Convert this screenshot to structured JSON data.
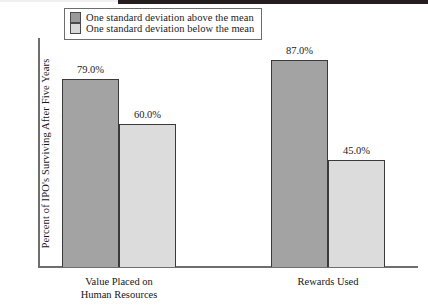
{
  "chart_data": {
    "type": "bar",
    "title": "",
    "xlabel": "",
    "ylabel": "Percent of IPO's Surviving After Five Years",
    "ylim": [
      0,
      96
    ],
    "grid": false,
    "legend_position": "top-center",
    "categories": [
      "Value Placed on\nHuman Resources",
      "Rewards Used"
    ],
    "series": [
      {
        "name": "One standard deviation above the mean",
        "color": "#a3a3a3",
        "values": [
          79.0,
          60.0
        ]
      },
      {
        "name": "One standard deviation below the mean",
        "color": "#dcdcdc",
        "values": [
          87.0,
          45.0
        ]
      }
    ],
    "data_labels": [
      "79.0%",
      "60.0%",
      "87.0%",
      "45.0%"
    ]
  },
  "legend": {
    "items": [
      {
        "label": "One standard deviation above the mean",
        "swatch": "above"
      },
      {
        "label": "One standard deviation below the mean",
        "swatch": "below"
      }
    ]
  },
  "axis": {
    "y_title": "Percent of IPO's Surviving After Five Years"
  },
  "categories": [
    {
      "line1": "Value Placed on",
      "line2": "Human Resources"
    },
    {
      "line1": "Rewards Used",
      "line2": ""
    }
  ],
  "bars": [
    {
      "label": "79.0%",
      "value": 79.0,
      "series": "above",
      "group": "Value Placed on Human Resources"
    },
    {
      "label": "60.0%",
      "value": 60.0,
      "series": "below",
      "group": "Value Placed on Human Resources"
    },
    {
      "label": "87.0%",
      "value": 87.0,
      "series": "above",
      "group": "Rewards Used"
    },
    {
      "label": "45.0%",
      "value": 45.0,
      "series": "below",
      "group": "Rewards Used"
    }
  ],
  "colors": {
    "series_above": "#a3a3a3",
    "series_below": "#dcdcdc",
    "bar_border": "#3a3a3a",
    "axis": "#6e6e6e",
    "text": "#1c1c1c",
    "background": "#ffffff"
  }
}
